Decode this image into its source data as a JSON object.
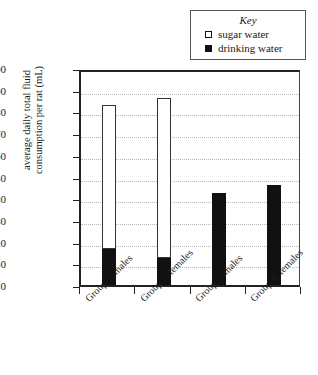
{
  "chart_data": {
    "type": "bar",
    "stacked": true,
    "title": "",
    "xlabel": "",
    "ylabel": "average daily total fluid consumption per rat (mL)",
    "ylabel_lines": [
      "average daily total fluid",
      "consumption per rat (mL)"
    ],
    "ylim": [
      0,
      100
    ],
    "yticks": [
      0,
      10,
      20,
      30,
      40,
      50,
      60,
      70,
      80,
      90,
      100
    ],
    "ytick_labels": [
      "0",
      "10",
      "20",
      "30",
      "40",
      "50",
      "60",
      "70",
      "80",
      "90",
      "100"
    ],
    "grid": true,
    "grid_axis": "y",
    "categories": [
      "Group 1: males",
      "Group 2: females",
      "Group 3: males",
      "Group 4: females"
    ],
    "series": [
      {
        "name": "drinking water",
        "color": "#111111",
        "swatch": "filled-square",
        "values": [
          16.5,
          12.5,
          42.5,
          46
        ]
      },
      {
        "name": "sugar water",
        "color": "#ffffff",
        "swatch": "open-square",
        "values": [
          66.5,
          73.5,
          0,
          0
        ]
      }
    ],
    "totals": [
      83,
      86,
      42.5,
      46
    ],
    "legend": {
      "title": "Key",
      "position": "top-right",
      "entries": [
        {
          "label": "sugar water",
          "swatch": "open-square"
        },
        {
          "label": "drinking water",
          "swatch": "filled-square"
        }
      ]
    }
  }
}
